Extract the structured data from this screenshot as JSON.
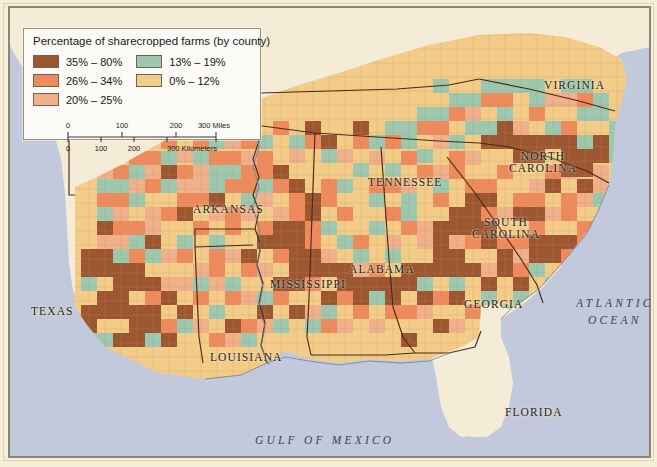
{
  "map": {
    "title": "Percentage of sharecropped farms (by county)",
    "projection_note": "Southeastern United States",
    "colors": {
      "class_35_80": "#9c5630",
      "class_26_34": "#ef8a5c",
      "class_20_25": "#f0b08a",
      "class_13_19": "#9bc8ae",
      "class_0_12": "#f3cd87",
      "no_data_land": "#f4ecd7",
      "ocean": "#c3c9dc",
      "state_border": "#4a2a18",
      "county_border": "#b08a6a",
      "coastline": "#6f7d96",
      "page_background": "#f6eed8",
      "legend_background": "#fbfaf6",
      "legend_border": "#9b9378"
    }
  },
  "legend": {
    "title": "Percentage of sharecropped farms (by county)",
    "columns": [
      {
        "items": [
          {
            "label": "35% – 80%",
            "color": "#9c5630",
            "min": 35,
            "max": 80
          },
          {
            "label": "26% – 34%",
            "color": "#ef8a5c",
            "min": 26,
            "max": 34
          },
          {
            "label": "20% – 25%",
            "color": "#f0b08a",
            "min": 20,
            "max": 25
          }
        ]
      },
      {
        "items": [
          {
            "label": "13% – 19%",
            "color": "#9bc8ae",
            "min": 13,
            "max": 19
          },
          {
            "label": "0% – 12%",
            "color": "#f3cd87",
            "min": 0,
            "max": 12
          }
        ]
      }
    ]
  },
  "scale_bar": {
    "miles": {
      "ticks": [
        "0",
        "100",
        "200",
        "300"
      ],
      "unit_label": "300 Miles",
      "unit": "Miles"
    },
    "kilometers": {
      "ticks": [
        "0",
        "100",
        "200",
        "300"
      ],
      "unit_label": "300 Kilometers",
      "unit": "Kilometers"
    }
  },
  "state_labels": [
    {
      "name": "TEXAS",
      "lines": [
        "TEXAS"
      ],
      "x": 22,
      "y": 298,
      "size": 11.5
    },
    {
      "name": "ARKANSAS",
      "lines": [
        "ARKANSAS"
      ],
      "x": 184,
      "y": 196,
      "size": 11.5
    },
    {
      "name": "LOUISIANA",
      "lines": [
        "LOUISIANA"
      ],
      "x": 201,
      "y": 344,
      "size": 11.5
    },
    {
      "name": "MISSISSIPPI",
      "lines": [
        "MISSISSIPPI"
      ],
      "x": 261,
      "y": 271,
      "size": 11.5
    },
    {
      "name": "ALABAMA",
      "lines": [
        "ALABAMA"
      ],
      "x": 340,
      "y": 256,
      "size": 11.5
    },
    {
      "name": "TENNESSEE",
      "lines": [
        "TENNESSEE"
      ],
      "x": 359,
      "y": 169,
      "size": 11.5
    },
    {
      "name": "GEORGIA",
      "lines": [
        "GEORGIA"
      ],
      "x": 455,
      "y": 291,
      "size": 11.5
    },
    {
      "name": "FLORIDA",
      "lines": [
        "FLORIDA"
      ],
      "x": 496,
      "y": 399,
      "size": 11.5
    },
    {
      "name": "VIRGINIA",
      "lines": [
        "VIRGINIA"
      ],
      "x": 535,
      "y": 72,
      "size": 11.5
    },
    {
      "name": "NORTH CAROLINA",
      "lines": [
        "NORTH",
        "CAROLINA"
      ],
      "x": 534,
      "y": 143,
      "size": 11.5
    },
    {
      "name": "SOUTH CAROLINA",
      "lines": [
        "SOUTH",
        "CAROLINA"
      ],
      "x": 497,
      "y": 209,
      "size": 11.5
    }
  ],
  "water_labels": [
    {
      "name": "ATLANTIC OCEAN",
      "lines": [
        "ATLANTIC",
        "OCEAN"
      ],
      "x": 567,
      "y": 288
    },
    {
      "name": "GULF OF MEXICO",
      "lines": [
        "GULF  OF  MEXICO"
      ],
      "x": 246,
      "y": 425
    }
  ],
  "chart_data": {
    "type": "map",
    "title": "Percentage of sharecropped farms (by county)",
    "classification": "choropleth, 5 classes, percent of farms operated by sharecroppers",
    "region": "Southeastern United States",
    "class_breaks": [
      {
        "label": "35% – 80%",
        "color": "#9c5630"
      },
      {
        "label": "26% – 34%",
        "color": "#ef8a5c"
      },
      {
        "label": "20% – 25%",
        "color": "#f0b08a"
      },
      {
        "label": "13% – 19%",
        "color": "#9bc8ae"
      },
      {
        "label": "0% – 12%",
        "color": "#f3cd87"
      }
    ],
    "states_shown": [
      "TEXAS",
      "ARKANSAS",
      "LOUISIANA",
      "MISSISSIPPI",
      "ALABAMA",
      "TENNESSEE",
      "GEORGIA",
      "FLORIDA",
      "VIRGINIA",
      "NORTH CAROLINA",
      "SOUTH CAROLINA"
    ],
    "water_bodies": [
      "ATLANTIC OCEAN",
      "GULF OF MEXICO"
    ]
  }
}
